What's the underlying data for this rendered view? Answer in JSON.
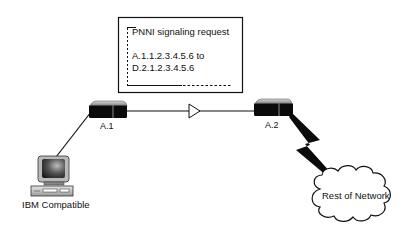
{
  "callout": {
    "title": "PNNI signaling request",
    "line1": "A.1.1.2.3.4.5.6 to",
    "line2": "D.2.1.2.3.4.5.6"
  },
  "nodes": {
    "switch_a1": {
      "label": "A.1",
      "icon": "atm-switch-icon"
    },
    "switch_a2": {
      "label": "A.2",
      "icon": "atm-switch-icon"
    },
    "pc": {
      "label": "IBM Compatible",
      "icon": "desktop-computer-icon"
    },
    "cloud": {
      "label": "Rest of Network",
      "icon": "cloud-icon"
    }
  },
  "links": [
    {
      "from": "A.1",
      "to": "A.2",
      "style": "line-with-arrow"
    },
    {
      "from": "A.1",
      "to": "IBM Compatible",
      "style": "line"
    },
    {
      "from": "A.2",
      "to": "Rest of Network",
      "style": "lightning-bolt"
    }
  ],
  "colors": {
    "line": "#111111",
    "background": "#ffffff",
    "switch_body": "#0a0a0a",
    "switch_top": "#9a9a9a"
  }
}
